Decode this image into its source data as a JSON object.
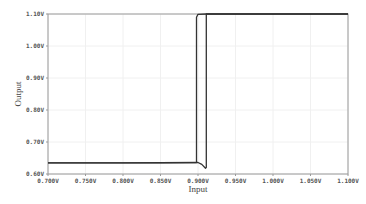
{
  "chart_data": {
    "type": "line",
    "title": "",
    "xlabel": "Input",
    "ylabel": "Output",
    "xlim": [
      0.7,
      1.1
    ],
    "ylim": [
      0.6,
      1.1
    ],
    "grid": true,
    "legend": null,
    "x_ticks": [
      "0.700",
      "0.750",
      "0.800",
      "0.850",
      "0.900",
      "0.950",
      "1.000",
      "1.050",
      "1.100"
    ],
    "y_ticks": [
      "0.60",
      "0.70",
      "0.80",
      "0.90",
      "1.00",
      "1.10"
    ],
    "series": [
      {
        "name": "forward sweep",
        "x": [
          0.7,
          0.8,
          0.9,
          0.905,
          0.91,
          0.911,
          0.911,
          0.95,
          1.0,
          1.1
        ],
        "y": [
          0.635,
          0.635,
          0.636,
          0.63,
          0.618,
          0.62,
          1.1,
          1.1,
          1.1,
          1.1
        ]
      },
      {
        "name": "reverse sweep",
        "x": [
          1.1,
          1.0,
          0.912,
          0.9,
          0.898,
          0.898,
          0.85,
          0.7
        ],
        "y": [
          1.1,
          1.1,
          1.1,
          1.099,
          1.09,
          0.636,
          0.635,
          0.635
        ]
      }
    ],
    "line_color": "#333333"
  }
}
